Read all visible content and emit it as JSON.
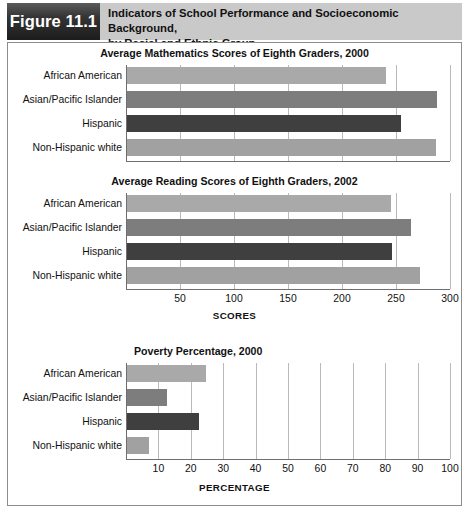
{
  "header": {
    "figure_tag": "Figure 11.1",
    "title_line1": "Indicators of School Performance and Socioeconomic Background,",
    "title_line2": "by Racial and Ethnic Group"
  },
  "colors": {
    "african_american": "#a9a9a9",
    "asian_pacific_islander": "#7d7d7d",
    "hispanic": "#3f3f3f",
    "non_hispanic_white": "#a1a1a1",
    "gridline": "#b9b9b9",
    "axis": "#6f6f6f",
    "header_bg": "#c9c9c9",
    "tag_bg": "#2a2a2a"
  },
  "chart_data": [
    {
      "id": "math",
      "type": "bar",
      "orientation": "horizontal",
      "title": "Average Mathematics Scores of Eighth Graders, 2000",
      "categories": [
        "African American",
        "Asian/Pacific Islander",
        "Hispanic",
        "Non-Hispanic white"
      ],
      "values": [
        241,
        288,
        255,
        287
      ],
      "xlabel": "",
      "ylabel": "",
      "xlim": [
        0,
        300
      ],
      "xticks": [
        50,
        100,
        150,
        200,
        250,
        300
      ],
      "xticklabels": [
        "",
        "",
        "",
        "",
        "",
        ""
      ],
      "grid": true,
      "legend": "none"
    },
    {
      "id": "reading",
      "type": "bar",
      "orientation": "horizontal",
      "title": "Average Reading Scores of Eighth Graders, 2002",
      "categories": [
        "African American",
        "Asian/Pacific Islander",
        "Hispanic",
        "Non-Hispanic white"
      ],
      "values": [
        245,
        264,
        246,
        272
      ],
      "xlabel": "SCORES",
      "ylabel": "",
      "xlim": [
        0,
        300
      ],
      "xticks": [
        50,
        100,
        150,
        200,
        250,
        300
      ],
      "xticklabels": [
        "50",
        "100",
        "150",
        "200",
        "250",
        "300"
      ],
      "grid": true,
      "legend": "none"
    },
    {
      "id": "poverty",
      "type": "bar",
      "orientation": "horizontal",
      "title": "Poverty Percentage, 2000",
      "categories": [
        "African American",
        "Asian/Pacific Islander",
        "Hispanic",
        "Non-Hispanic white"
      ],
      "values": [
        24.6,
        12.8,
        22.4,
        7.0
      ],
      "xlabel": "PERCENTAGE",
      "ylabel": "",
      "xlim": [
        0,
        100
      ],
      "xticks": [
        10,
        20,
        30,
        40,
        50,
        60,
        70,
        80,
        90,
        100
      ],
      "xticklabels": [
        "10",
        "20",
        "30",
        "40",
        "50",
        "60",
        "70",
        "80",
        "90",
        "100"
      ],
      "grid": true,
      "legend": "none"
    }
  ]
}
